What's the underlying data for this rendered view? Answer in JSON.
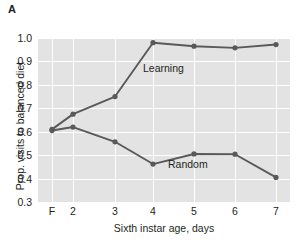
{
  "panel": {
    "label": "A"
  },
  "chart_data": {
    "type": "line",
    "title": "",
    "xlabel": "Sixth instar age, days",
    "ylabel": "Prop. visits to balanced diet",
    "categories": [
      "F",
      "2",
      "3",
      "4",
      "5",
      "6",
      "7"
    ],
    "xtick_labels": [
      "F",
      "2",
      "3",
      "4",
      "5",
      "6",
      "7"
    ],
    "ytick_labels": [
      "1.0",
      "0.9",
      "0.8",
      "0.7",
      "0.6",
      "0.5",
      "0.4",
      "0.3"
    ],
    "ytick_values": [
      1.0,
      0.9,
      0.8,
      0.7,
      0.6,
      0.5,
      0.4,
      0.3
    ],
    "ylim": [
      0.3,
      1.0
    ],
    "grid": true,
    "legend_position": "inline-annotation",
    "plot_background": "#e3e3e3",
    "grid_color": "#ffffff",
    "series": [
      {
        "name": "Learning",
        "color": "#595959",
        "values": [
          0.61,
          0.675,
          0.75,
          0.98,
          0.965,
          0.958,
          0.972
        ]
      },
      {
        "name": "Random",
        "color": "#595959",
        "values": [
          0.605,
          0.62,
          0.557,
          0.462,
          0.505,
          0.504,
          0.405
        ]
      }
    ],
    "annotations": [
      {
        "text": "Learning",
        "series": "Learning"
      },
      {
        "text": "Random",
        "series": "Random"
      }
    ]
  },
  "axis": {
    "x_positions_px": [
      52,
      73,
      115,
      153,
      194,
      235,
      276
    ]
  }
}
